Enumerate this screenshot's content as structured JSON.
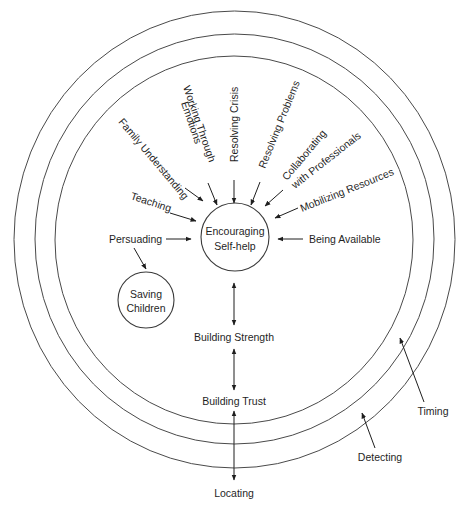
{
  "diagram": {
    "rings": [
      {
        "name": "outer-ring",
        "cx": 234.5,
        "cy": 239.5,
        "rx": 220.5,
        "ry": 228.5
      },
      {
        "name": "middle-ring",
        "cx": 234.5,
        "cy": 239,
        "rx": 199.5,
        "ry": 205
      },
      {
        "name": "inner-ring",
        "cx": 234,
        "cy": 240,
        "rx": 179,
        "ry": 184
      }
    ],
    "center_node": {
      "line1": "Encouraging",
      "line2": "Self-help",
      "cx": 235,
      "cy": 237,
      "r": 34
    },
    "secondary_node": {
      "line1": "Saving",
      "line2": "Children",
      "cx": 146,
      "cy": 300,
      "r": 28
    },
    "labels": {
      "family_understanding": "Family Understanding",
      "working_through_1": "Working Through",
      "working_through_2": "Emotions",
      "resolving_crisis": "Resolving Crisis",
      "resolving_problems": "Resolving Problems",
      "collaborating_1": "Collaborating",
      "collaborating_2": "with Professionals",
      "mobilizing_resources": "Mobilizing Resources",
      "teaching": "Teaching",
      "persuading": "Persuading",
      "being_available": "Being Available",
      "building_strength": "Building Strength",
      "building_trust": "Building Trust",
      "locating": "Locating",
      "detecting": "Detecting",
      "timing": "Timing"
    }
  }
}
